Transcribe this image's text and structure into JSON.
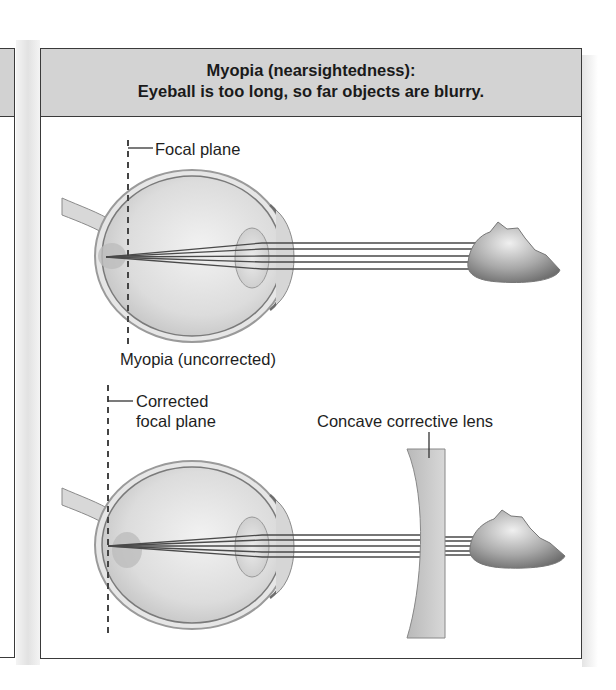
{
  "header": {
    "title_line1": "Myopia (nearsightedness):",
    "title_line2": "Eyeball is too long, so far objects are blurry."
  },
  "top_diagram": {
    "focal_plane_label": "Focal plane",
    "caption": "Myopia (uncorrected)"
  },
  "bottom_diagram": {
    "corrected_focal_label_line1": "Corrected",
    "corrected_focal_label_line2": "focal plane",
    "lens_label": "Concave corrective lens"
  },
  "colors": {
    "header_bg": "#d3d3d3",
    "border": "#3a3a3a",
    "ray": "#4a4a4a",
    "lens": "#c8c8c8"
  }
}
